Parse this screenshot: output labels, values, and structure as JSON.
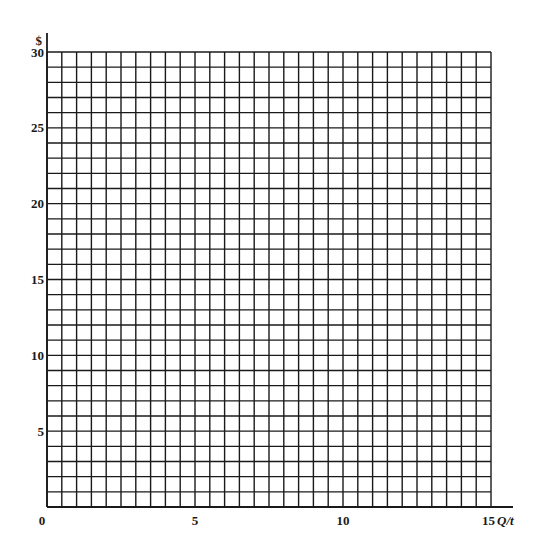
{
  "chart_data": {
    "type": "grid",
    "title": "",
    "xlabel": "Q/t",
    "ylabel": "$",
    "xlim": [
      0,
      15
    ],
    "ylim": [
      0,
      30
    ],
    "x_ticks": [
      {
        "value": 0,
        "label": "0"
      },
      {
        "value": 5,
        "label": "5"
      },
      {
        "value": 10,
        "label": "10"
      },
      {
        "value": 15,
        "label": "15"
      }
    ],
    "y_ticks": [
      {
        "value": 5,
        "label": "5"
      },
      {
        "value": 10,
        "label": "10"
      },
      {
        "value": 15,
        "label": "15"
      },
      {
        "value": 20,
        "label": "20"
      },
      {
        "value": 25,
        "label": "25"
      },
      {
        "value": 30,
        "label": "30"
      }
    ],
    "grid": true,
    "grid_x_step": 0.5,
    "grid_y_step": 1,
    "series": [],
    "legend": null
  },
  "style": {
    "line_color": "#1a1a1a",
    "background": "#ffffff"
  },
  "layout": {
    "plot_left": 47,
    "plot_right": 491,
    "plot_top": 52,
    "plot_bottom": 507,
    "x_axis_end": 513,
    "y_axis_top": 33
  }
}
